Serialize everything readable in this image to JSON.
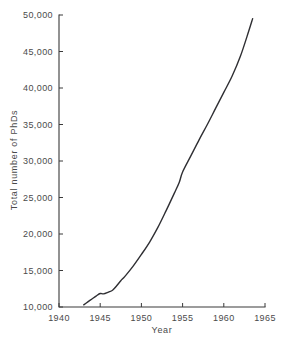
{
  "chart_data": {
    "type": "line",
    "title": "",
    "xlabel": "Year",
    "ylabel": "Total number of PhDs",
    "xlim": [
      1940,
      1965
    ],
    "ylim": [
      10000,
      50000
    ],
    "grid": false,
    "legend": "none",
    "x_ticks": [
      "1940",
      "1945",
      "1950",
      "1955",
      "1960",
      "1965"
    ],
    "x_tick_values": [
      1940,
      1945,
      1950,
      1955,
      1960,
      1965
    ],
    "y_ticks": [
      "10,000",
      "15,000",
      "20,000",
      "25,000",
      "30,000",
      "35,000",
      "40,000",
      "45,000",
      "50,000"
    ],
    "y_tick_values": [
      10000,
      15000,
      20000,
      25000,
      30000,
      35000,
      40000,
      45000,
      50000
    ],
    "series": [
      {
        "name": "Total number of PhDs",
        "color": "#2f2f33",
        "x": [
          1943.0,
          1943.5,
          1944.0,
          1944.5,
          1945.0,
          1945.4,
          1946.0,
          1946.5,
          1947.0,
          1947.5,
          1948.0,
          1949.0,
          1950.0,
          1951.0,
          1952.0,
          1953.0,
          1954.0,
          1954.6,
          1955.0,
          1956.0,
          1957.0,
          1958.0,
          1959.0,
          1960.0,
          1961.0,
          1962.0,
          1963.0,
          1963.5
        ],
        "values": [
          10300,
          10700,
          11100,
          11500,
          11850,
          11800,
          12050,
          12300,
          12900,
          13600,
          14200,
          15600,
          17200,
          18900,
          20900,
          23200,
          25600,
          27100,
          28500,
          30700,
          32900,
          35000,
          37200,
          39400,
          41600,
          44300,
          47700,
          49500
        ]
      }
    ]
  },
  "axes": {
    "x_axis_label": "Year",
    "y_axis_label": "Total number of PhDs"
  }
}
